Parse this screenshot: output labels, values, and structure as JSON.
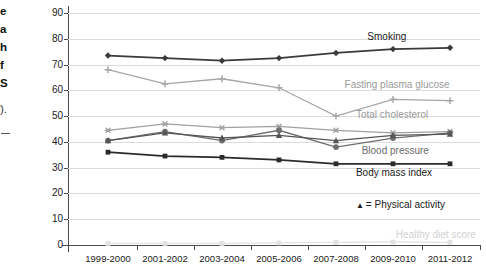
{
  "gutter": {
    "fragments": [
      "e",
      "a",
      "h",
      "f",
      "S",
      ")."
    ],
    "dash": "-"
  },
  "axis": {
    "ylabel": "Percent of population",
    "yticks": [
      "90",
      "80",
      "70",
      "60",
      "50",
      "40",
      "30",
      "20",
      "10",
      "0"
    ]
  },
  "chart_data": {
    "type": "line",
    "title": "",
    "xlabel": "",
    "ylabel": "Percent of population",
    "ylim": [
      0,
      90
    ],
    "yticks": [
      0,
      10,
      20,
      30,
      40,
      50,
      60,
      70,
      80,
      90
    ],
    "grid": true,
    "legend_position": "inline-right",
    "categories": [
      "1999-2000",
      "2001-2002",
      "2003-2004",
      "2005-2006",
      "2007-2008",
      "2009-2010",
      "2011-2012"
    ],
    "series": [
      {
        "name": "Smoking",
        "color": "#3a3a3a",
        "marker": "diamond",
        "values": [
          73.5,
          72.5,
          71.5,
          72.5,
          74.5,
          76.0,
          76.5
        ]
      },
      {
        "name": "Fasting plasma glucose",
        "color": "#a6a6a6",
        "marker": "plus",
        "values": [
          68.0,
          62.5,
          64.5,
          61.0,
          50.0,
          56.5,
          56.0
        ]
      },
      {
        "name": "Total cholesterol",
        "color": "#a0a0a0",
        "marker": "star",
        "values": [
          44.5,
          47.0,
          45.5,
          46.0,
          44.5,
          43.5,
          44.0
        ]
      },
      {
        "name": "Blood pressure",
        "color": "#6e6e6e",
        "marker": "circle",
        "values": [
          40.5,
          44.0,
          40.5,
          44.5,
          38.0,
          41.5,
          43.5
        ]
      },
      {
        "name": "Physical activity",
        "color": "#555555",
        "marker": "triangle",
        "values": [
          40.5,
          43.5,
          41.5,
          42.5,
          40.5,
          42.5,
          43.0
        ]
      },
      {
        "name": "Body mass index",
        "color": "#2b2b2b",
        "marker": "square",
        "values": [
          36.0,
          34.5,
          34.0,
          33.0,
          31.5,
          31.5,
          31.5
        ]
      },
      {
        "name": "Healthy diet score",
        "color": "#e2e2e2",
        "marker": "square",
        "values": [
          0.6,
          0.6,
          0.6,
          0.8,
          1.0,
          1.2,
          1.0
        ]
      }
    ],
    "annotations": [
      {
        "text": "Smoking",
        "x": 4.55,
        "y": 80.5,
        "color": "#1a1a1a"
      },
      {
        "text": "Fasting plasma glucose",
        "x": 4.15,
        "y": 62.0,
        "color": "#9a9a9a"
      },
      {
        "text": "Total cholesterol",
        "x": 4.35,
        "y": 50.5,
        "color": "#9a9a9a"
      },
      {
        "text": "Blood pressure",
        "x": 4.45,
        "y": 36.5,
        "color": "#6b6b6b"
      },
      {
        "text": "Body mass index",
        "x": 4.35,
        "y": 28.0,
        "color": "#1a1a1a"
      },
      {
        "text": "Healthy diet score",
        "x": 5.05,
        "y": 4.0,
        "color": "#d2d2d2"
      }
    ],
    "legend_inline": {
      "marker": "triangle",
      "glyph": "▲",
      "text": "= Physical activity",
      "color": "#1a1a1a"
    }
  }
}
